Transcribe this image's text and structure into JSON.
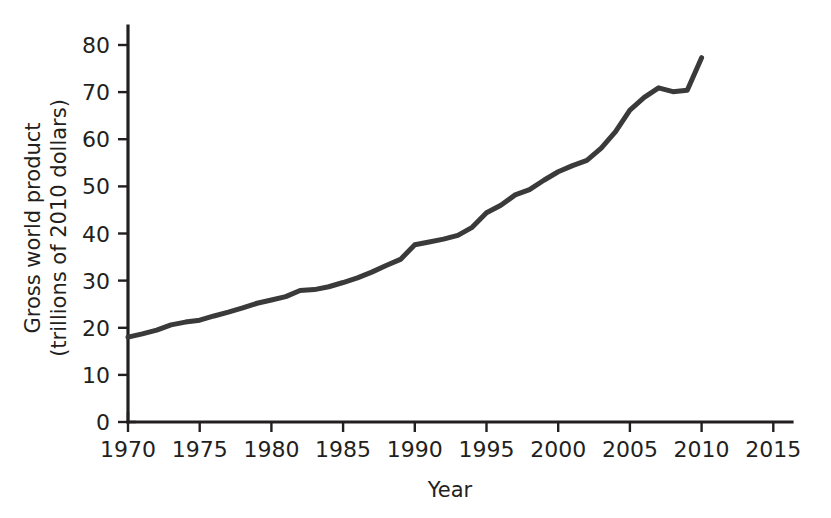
{
  "chart_data": {
    "type": "line",
    "title": "",
    "xlabel": "Year",
    "ylabel": "Gross world product (trillions of 2010 dollars)",
    "ylabel_line1": "Gross world product",
    "ylabel_line2": "(trillions of 2010 dollars)",
    "xlim": [
      1968.2,
      2017.5
    ],
    "ylim": [
      0,
      84
    ],
    "grid": false,
    "legend": null,
    "xticks": [
      1970,
      1975,
      1980,
      1985,
      1990,
      1995,
      2000,
      2005,
      2010,
      2015
    ],
    "xtick_labels": [
      "1970",
      "1975",
      "1980",
      "1985",
      "1990",
      "1995",
      "2000",
      "2005",
      "2010",
      "2015"
    ],
    "yticks": [
      0,
      10,
      20,
      30,
      40,
      50,
      60,
      70,
      80
    ],
    "ytick_labels": [
      "0",
      "10",
      "20",
      "30",
      "40",
      "50",
      "60",
      "70",
      "80"
    ],
    "line_color": "#3a3a3a",
    "axis_color": "#231f20",
    "series": [
      {
        "name": "Gross world product",
        "x": [
          1970,
          1971,
          1972,
          1973,
          1974,
          1975,
          1976,
          1977,
          1978,
          1979,
          1980,
          1981,
          1982,
          1983,
          1984,
          1985,
          1986,
          1987,
          1988,
          1989,
          1990,
          1991,
          1992,
          1993,
          1994,
          1995,
          1996,
          1997,
          1998,
          1999,
          2000,
          2001,
          2002,
          2003,
          2004,
          2005,
          2006,
          2007,
          2008,
          2009,
          2010
        ],
        "y": [
          18.0,
          18.7,
          19.5,
          20.6,
          21.2,
          21.6,
          22.5,
          23.3,
          24.2,
          25.2,
          25.9,
          26.6,
          27.9,
          28.1,
          28.7,
          29.6,
          30.6,
          31.8,
          33.2,
          34.5,
          37.6,
          38.2,
          38.8,
          39.6,
          41.3,
          44.4,
          46.0,
          48.2,
          49.3,
          51.3,
          53.1,
          54.4,
          55.5,
          58.1,
          61.6,
          66.2,
          68.9,
          70.9,
          70.1,
          70.4,
          77.3
        ]
      }
    ]
  }
}
